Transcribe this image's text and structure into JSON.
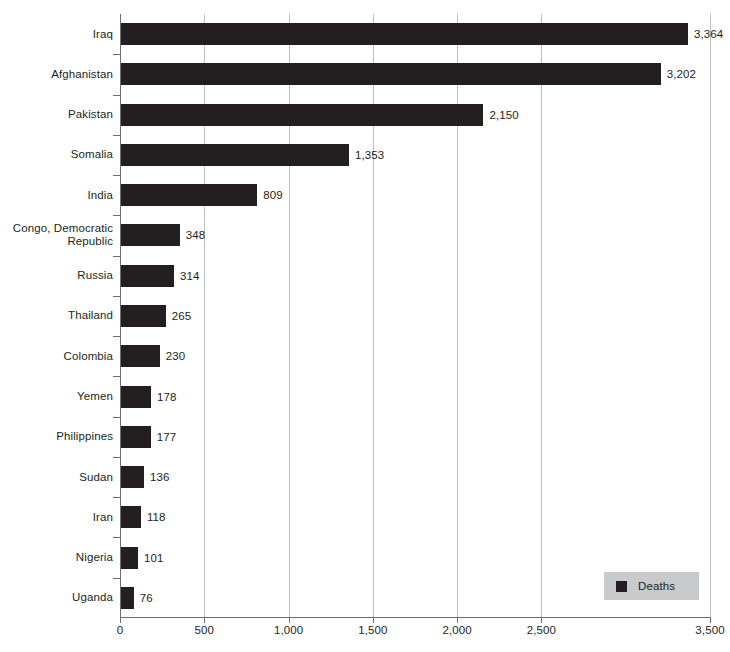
{
  "chart_data": {
    "type": "bar",
    "orientation": "horizontal",
    "title": "",
    "subtitle": "",
    "xlabel": "",
    "ylabel": "",
    "xlim": [
      0,
      3500
    ],
    "ylim": null,
    "grid": true,
    "legend": {
      "position": "bottom-right",
      "entries": [
        {
          "label": "Deaths",
          "color": "#231f20"
        }
      ]
    },
    "xticks": [
      {
        "value": 0,
        "label": "0"
      },
      {
        "value": 500,
        "label": "500"
      },
      {
        "value": 1000,
        "label": "1,000"
      },
      {
        "value": 1500,
        "label": "1,500"
      },
      {
        "value": 2000,
        "label": "2,000"
      },
      {
        "value": 2500,
        "label": "2,500"
      },
      {
        "value": 3500,
        "label": "3,500"
      }
    ],
    "categories": [
      "Iraq",
      "Afghanistan",
      "Pakistan",
      "Somalia",
      "India",
      "Congo, Democratic Republic",
      "Russia",
      "Thailand",
      "Colombia",
      "Yemen",
      "Philippines",
      "Sudan",
      "Iran",
      "Nigeria",
      "Uganda"
    ],
    "values": [
      3364,
      3202,
      2150,
      1353,
      809,
      348,
      314,
      265,
      230,
      178,
      177,
      136,
      118,
      101,
      76
    ],
    "value_labels": [
      "3,364",
      "3,202",
      "2,150",
      "1,353",
      "809",
      "348",
      "314",
      "265",
      "230",
      "178",
      "177",
      "136",
      "118",
      "101",
      "76"
    ],
    "series": [
      {
        "name": "Deaths",
        "values": [
          3364,
          3202,
          2150,
          1353,
          809,
          348,
          314,
          265,
          230,
          178,
          177,
          136,
          118,
          101,
          76
        ]
      }
    ]
  },
  "style": {
    "bar_color": "#231f20",
    "grid_color": "#bcbec0",
    "axis_color": "#6d6e71",
    "legend_background": "#c9cacc",
    "background": "#ffffff",
    "text_color": "#231f20"
  }
}
